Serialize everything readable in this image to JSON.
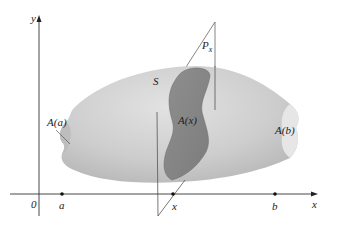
{
  "diagram": {
    "type": "solid-cross-section",
    "axes": {
      "y_label": "y",
      "x_label": "x",
      "origin_label": "0"
    },
    "points_on_x_axis": [
      {
        "label": "a"
      },
      {
        "label": "x"
      },
      {
        "label": "b"
      }
    ],
    "labels": {
      "solid": "S",
      "plane": "P",
      "plane_subscript": "x",
      "left_section": "A(a)",
      "middle_section": "A(x)",
      "right_section": "A(b)"
    },
    "colors": {
      "solid_fill": "#c8c8c8",
      "solid_light": "#dedede",
      "cross_section_fill": "#8a8a8a",
      "axis_stroke": "#333333",
      "plane_stroke": "#555555",
      "background": "#ffffff"
    }
  }
}
